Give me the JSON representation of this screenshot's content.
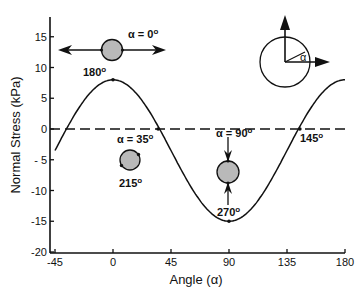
{
  "chart_data": {
    "type": "line",
    "title": "",
    "xlabel": "Angle (α)",
    "ylabel": "Normal Stress (kPa)",
    "xlim": [
      -45,
      180
    ],
    "ylim": [
      -20,
      18
    ],
    "xticks": [
      -45,
      0,
      45,
      90,
      135,
      180
    ],
    "yticks": [
      15,
      10,
      5,
      0,
      -5,
      -10,
      -15,
      -20
    ],
    "xtick_labels": [
      "-45",
      "0",
      "45",
      "90",
      "135",
      "180"
    ],
    "ytick_labels": [
      "15",
      "10",
      "5",
      "0",
      "- 5",
      "-10",
      "-15",
      "-20"
    ],
    "grid": false,
    "legend": null,
    "series": [
      {
        "name": "Normal Stress",
        "style": "solid",
        "x": [
          -45,
          -30,
          -15,
          0,
          15,
          30,
          35,
          45,
          60,
          75,
          90,
          105,
          120,
          135,
          145,
          150,
          165,
          180
        ],
        "values": [
          -3.5,
          2.25,
          6.46,
          8.0,
          6.46,
          2.25,
          0.4,
          -3.5,
          -9.25,
          -13.46,
          -15.0,
          -13.46,
          -9.25,
          -3.5,
          0.4,
          2.25,
          6.46,
          8.0
        ]
      },
      {
        "name": "Zero line",
        "style": "dashed",
        "x": [
          -45,
          180
        ],
        "values": [
          0,
          0
        ]
      }
    ],
    "marked_points": [
      {
        "x": 0,
        "y": 8.0
      },
      {
        "x": 35,
        "y": 0
      },
      {
        "x": 90,
        "y": -15.0
      },
      {
        "x": 145,
        "y": 0
      }
    ],
    "annotations": [
      {
        "id": "alpha0",
        "text": "α = 0",
        "sup": "o"
      },
      {
        "id": "deg180",
        "text": "180",
        "sup": "o"
      },
      {
        "id": "alpha35",
        "text": "α = 35",
        "sup": "o"
      },
      {
        "id": "deg215",
        "text": "215",
        "sup": "o"
      },
      {
        "id": "alpha90",
        "text": "α = 90",
        "sup": "o"
      },
      {
        "id": "deg270",
        "text": "270",
        "sup": "o"
      },
      {
        "id": "deg145",
        "text": "145",
        "sup": "o"
      },
      {
        "id": "inset_alpha",
        "text": "α",
        "sup": ""
      }
    ],
    "inset": "Unit circle with vertical and horizontal arrows; angle α measured from horizontal",
    "colors": {
      "line": "#111111",
      "circle_fill": "#b9b9b9",
      "circle_stroke": "#111111"
    }
  }
}
